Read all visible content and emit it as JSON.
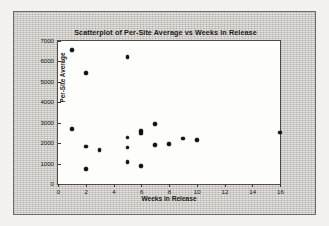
{
  "chart_data": {
    "type": "scatter",
    "title": "Scatterplot of Per-Site Average vs Weeks in Release",
    "xlabel": "Weeks in Release",
    "ylabel": "Per-Site Average",
    "xlim": [
      0,
      16
    ],
    "ylim": [
      0,
      7000
    ],
    "xticks": [
      0,
      2,
      4,
      6,
      8,
      10,
      12,
      14,
      16
    ],
    "yticks": [
      0,
      1000,
      2000,
      3000,
      4000,
      5000,
      6000,
      7000
    ],
    "xtick_labels": [
      "0",
      "2",
      "4",
      "6",
      "8",
      "10",
      "12",
      "14",
      "16"
    ],
    "ytick_labels": [
      "0",
      "1000",
      "2000",
      "3000",
      "4000",
      "5000",
      "6000",
      "7000"
    ],
    "grid": false,
    "legend": null,
    "marker": {
      "shape": "circle",
      "color": "#121110",
      "size": 3.6
    },
    "plot_background": "#fdfdfb",
    "panel_background": "#c9c6c0",
    "points": [
      {
        "x": 1,
        "y": 6550
      },
      {
        "x": 1,
        "y": 2700
      },
      {
        "x": 2,
        "y": 5420
      },
      {
        "x": 2,
        "y": 1830
      },
      {
        "x": 2,
        "y": 720
      },
      {
        "x": 3,
        "y": 1650
      },
      {
        "x": 5,
        "y": 6210
      },
      {
        "x": 5,
        "y": 2280
      },
      {
        "x": 5,
        "y": 1780
      },
      {
        "x": 5,
        "y": 1080
      },
      {
        "x": 6,
        "y": 2600
      },
      {
        "x": 6,
        "y": 2480
      },
      {
        "x": 6,
        "y": 880
      },
      {
        "x": 7,
        "y": 2930
      },
      {
        "x": 7,
        "y": 1900
      },
      {
        "x": 8,
        "y": 1960
      },
      {
        "x": 9,
        "y": 2230
      },
      {
        "x": 10,
        "y": 2140
      },
      {
        "x": 16,
        "y": 2520
      }
    ]
  }
}
